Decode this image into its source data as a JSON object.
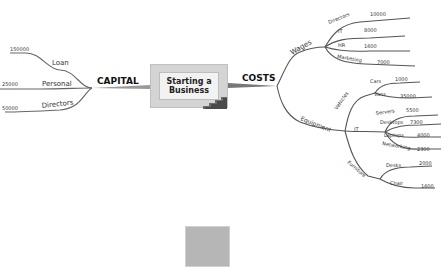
{
  "center": {
    "line1": "Starting a",
    "line2": "Business"
  },
  "capital": {
    "label": "CAPITAL",
    "branches": [
      {
        "label": "Loan",
        "value": "150000"
      },
      {
        "label": "Personal",
        "value": "25000"
      },
      {
        "label": "Directors",
        "value": "50000"
      }
    ]
  },
  "costs": {
    "label": "COSTS",
    "wages": {
      "label": "Wages",
      "items": [
        {
          "label": "Directors",
          "value": "10000"
        },
        {
          "label": "IT",
          "value": "8000"
        },
        {
          "label": "HR",
          "value": "1600"
        },
        {
          "label": "Marketing",
          "value": "7000"
        }
      ]
    },
    "equipment": {
      "label": "Equipment",
      "vehicles": {
        "label": "Vehicles",
        "items": [
          {
            "label": "Cars",
            "value": "1000"
          },
          {
            "label": "Vans",
            "value": "35000"
          }
        ]
      },
      "it": {
        "label": "IT",
        "items": [
          {
            "label": "Servers",
            "value": "5500"
          },
          {
            "label": "Desktops",
            "value": "7300"
          },
          {
            "label": "Laptops",
            "value": "4000"
          },
          {
            "label": "Networking",
            "value": "2300"
          }
        ]
      },
      "furniture": {
        "label": "Furniture",
        "items": [
          {
            "label": "Desks",
            "value": "2000"
          },
          {
            "label": "Chair",
            "value": "1600"
          }
        ]
      }
    }
  },
  "colors": {
    "branch": "#555555",
    "box": "#d4d4d4",
    "placeholder": "#b6b6b6"
  }
}
